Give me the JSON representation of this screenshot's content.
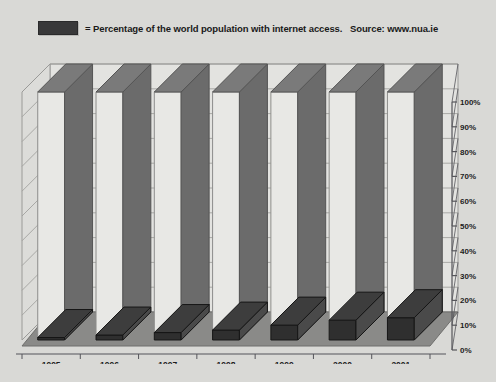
{
  "legend": {
    "swatch_name": "legend-color-swatch",
    "text": "= Percentage of the world population with internet access.   Source: www.nua.ie",
    "swatch_color": "#39393a"
  },
  "colors": {
    "background": "#d9d9d6",
    "back_wall": "#e3e3e0",
    "left_wall": "#dcdcd9",
    "floor": "#8a8a88",
    "floor_edge": "#6f6f6d",
    "pillar_front": "#e8e8e5",
    "pillar_side": "#6b6b6b",
    "pillar_top": "#7a7a7a",
    "bar_front": "#2f2f2f",
    "bar_side": "#4a4a4a",
    "bar_top": "#3d3d3d",
    "gridline": "#9a9a98",
    "axis_line": "#55555a"
  },
  "chart_data": {
    "type": "bar",
    "title": "",
    "subtitle": "",
    "xlabel": "",
    "ylabel": "",
    "ylim": [
      0,
      100
    ],
    "grid": true,
    "legend_position": "top",
    "categories": [
      "1995",
      "1996",
      "1997",
      "1998",
      "1999",
      "2000",
      "2001"
    ],
    "series": [
      {
        "name": "Percentage of the world population with internet access",
        "values": [
          1,
          2,
          3,
          4,
          6,
          8,
          9
        ]
      }
    ],
    "y_ticks": [
      0,
      10,
      20,
      30,
      40,
      50,
      60,
      70,
      80,
      90,
      100
    ],
    "y_tick_labels": [
      "0%",
      "10%",
      "20%",
      "30%",
      "40%",
      "50%",
      "60%",
      "70%",
      "80%",
      "90%",
      "100%"
    ],
    "source": "www.nua.ie",
    "note": "3D column chart; each data bar sits at the base of a full-height decorative 3D pillar"
  }
}
